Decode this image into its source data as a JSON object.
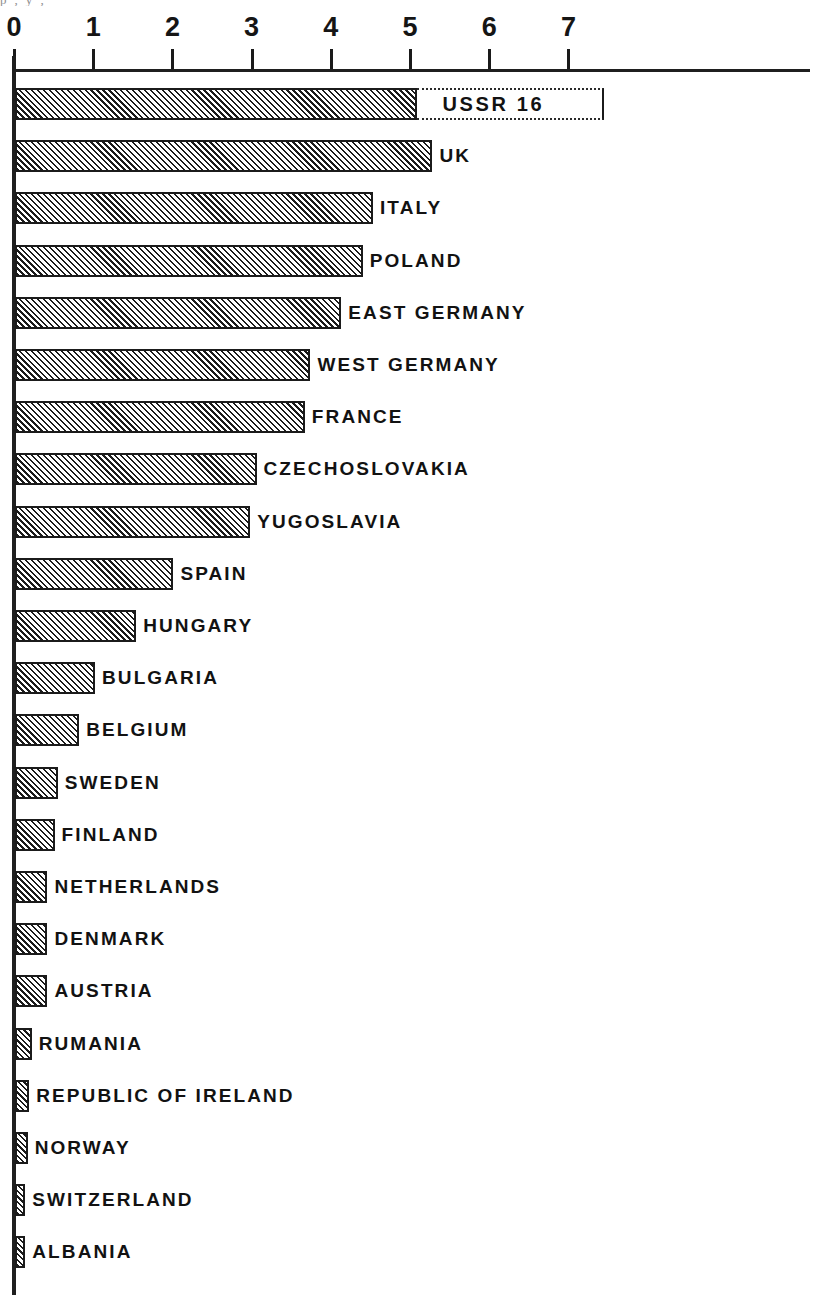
{
  "chart_data": {
    "type": "bar",
    "orientation": "horizontal",
    "title": "",
    "subtitle": "",
    "xlabel": "",
    "ylabel": "",
    "xlim": [
      0,
      7
    ],
    "xticks": [
      "0",
      "1",
      "2",
      "3",
      "4",
      "5",
      "6",
      "7"
    ],
    "xtick_values": [
      0,
      1,
      2,
      3,
      4,
      5,
      6,
      7
    ],
    "grid": false,
    "legend": false,
    "categories": [
      "USSR",
      "UK",
      "ITALY",
      "POLAND",
      "EAST GERMANY",
      "WEST GERMANY",
      "FRANCE",
      "CZECHOSLOVAKIA",
      "YUGOSLAVIA",
      "SPAIN",
      "HUNGARY",
      "BULGARIA",
      "BELGIUM",
      "SWEDEN",
      "FINLAND",
      "NETHERLANDS",
      "DENMARK",
      "AUSTRIA",
      "RUMANIA",
      "REPUBLIC OF IRELAND",
      "NORWAY",
      "SWITZERLAND",
      "ALBANIA"
    ],
    "values": [
      16.0,
      5.27,
      4.52,
      4.39,
      4.12,
      3.73,
      3.66,
      3.05,
      2.97,
      2.0,
      1.53,
      1.01,
      0.81,
      0.54,
      0.5,
      0.41,
      0.41,
      0.41,
      0.21,
      0.18,
      0.16,
      0.13,
      0.13
    ],
    "broken_axis_bar": {
      "category": "USSR",
      "value": 16,
      "value_label": "USSR 16",
      "drawn_to": 5.07,
      "extension_to": 7.45
    },
    "annotations": [
      {
        "text": "USSR 16",
        "placement": "inside-bar-extension"
      }
    ],
    "style": {
      "bar_fill": "hatched-45-degree",
      "bar_border_color": "#1b1b1b",
      "background": "#ffffff",
      "text_color": "#121212"
    }
  },
  "axis": {
    "ticks": [
      {
        "label": "0",
        "value": 0
      },
      {
        "label": "1",
        "value": 1
      },
      {
        "label": "2",
        "value": 2
      },
      {
        "label": "3",
        "value": 3
      },
      {
        "label": "4",
        "value": 4
      },
      {
        "label": "5",
        "value": 5
      },
      {
        "label": "6",
        "value": 6
      },
      {
        "label": "7",
        "value": 7
      }
    ]
  },
  "bars": [
    {
      "label": "USSR 16",
      "value": 16.0,
      "broken": true
    },
    {
      "label": "UK",
      "value": 5.27,
      "broken": false
    },
    {
      "label": "ITALY",
      "value": 4.52,
      "broken": false
    },
    {
      "label": "POLAND",
      "value": 4.39,
      "broken": false
    },
    {
      "label": "EAST GERMANY",
      "value": 4.12,
      "broken": false
    },
    {
      "label": "WEST GERMANY",
      "value": 3.73,
      "broken": false
    },
    {
      "label": "FRANCE",
      "value": 3.66,
      "broken": false
    },
    {
      "label": "CZECHOSLOVAKIA",
      "value": 3.05,
      "broken": false
    },
    {
      "label": "YUGOSLAVIA",
      "value": 2.97,
      "broken": false
    },
    {
      "label": "SPAIN",
      "value": 2.0,
      "broken": false
    },
    {
      "label": "HUNGARY",
      "value": 1.53,
      "broken": false
    },
    {
      "label": "BULGARIA",
      "value": 1.01,
      "broken": false
    },
    {
      "label": "BELGIUM",
      "value": 0.81,
      "broken": false
    },
    {
      "label": "SWEDEN",
      "value": 0.54,
      "broken": false
    },
    {
      "label": "FINLAND",
      "value": 0.5,
      "broken": false
    },
    {
      "label": "NETHERLANDS",
      "value": 0.41,
      "broken": false
    },
    {
      "label": "DENMARK",
      "value": 0.41,
      "broken": false
    },
    {
      "label": "AUSTRIA",
      "value": 0.41,
      "broken": false
    },
    {
      "label": "RUMANIA",
      "value": 0.21,
      "broken": false
    },
    {
      "label": "REPUBLIC OF IRELAND",
      "value": 0.18,
      "broken": false
    },
    {
      "label": "NORWAY",
      "value": 0.16,
      "broken": false
    },
    {
      "label": "SWITZERLAND",
      "value": 0.13,
      "broken": false
    },
    {
      "label": "ALBANIA",
      "value": 0.13,
      "broken": false
    }
  ],
  "ghost_text": "p ,  y  ,"
}
